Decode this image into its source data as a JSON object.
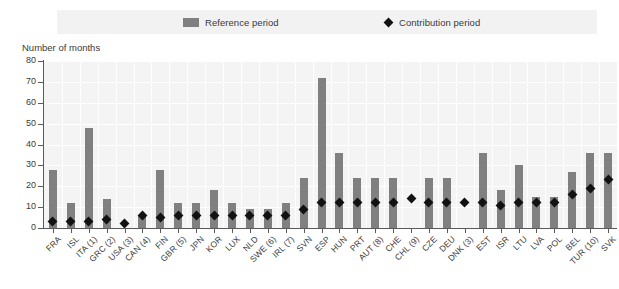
{
  "legend": {
    "reference": {
      "label": "Reference period",
      "icon": "bar-swatch",
      "color": "#808080"
    },
    "contribution": {
      "label": "Contribution period",
      "icon": "diamond-marker",
      "color": "#121212"
    }
  },
  "axis_title": "Number of months",
  "chart_data": {
    "type": "bar",
    "title": "",
    "subtitle": "",
    "xlabel": "",
    "ylabel": "Number of months",
    "ylim": [
      0,
      80
    ],
    "ytick_values": [
      0,
      10,
      20,
      30,
      40,
      50,
      60,
      70,
      80
    ],
    "ytick_labels": [
      "0",
      "10",
      "20",
      "30",
      "40",
      "50",
      "60",
      "70",
      "80"
    ],
    "grid": true,
    "legend_position": "top",
    "categories": [
      "FRA",
      "ISL",
      "ITA (1)",
      "GRC (2)",
      "USA (3)",
      "CAN (4)",
      "FIN",
      "GBR (5)",
      "JPN",
      "KOR",
      "LUX",
      "NLD",
      "SWE (6)",
      "IRL (7)",
      "SVN",
      "ESP",
      "HUN",
      "PRT",
      "AUT (8)",
      "CHE",
      "CHL (9)",
      "CZE",
      "DEU",
      "DNK (3)",
      "EST",
      "ISR",
      "LTU",
      "LVA",
      "POL",
      "BEL",
      "TUR (10)",
      "SVK"
    ],
    "series": [
      {
        "name": "Reference period",
        "type": "bar",
        "color": "#808080",
        "values": [
          28,
          12,
          48,
          14,
          0,
          6,
          28,
          12,
          12,
          18,
          12,
          9,
          9,
          12,
          24,
          72,
          36,
          24,
          24,
          24,
          0,
          24,
          24,
          0,
          36,
          18,
          30,
          15,
          15,
          27,
          36,
          36
        ]
      },
      {
        "name": "Contribution period",
        "type": "scatter",
        "marker": "diamond",
        "color": "#121212",
        "values": [
          3,
          3,
          3,
          4,
          2,
          6,
          5,
          6,
          6,
          6,
          6,
          6,
          6,
          6,
          9,
          12,
          12,
          12,
          12,
          12,
          14,
          12,
          12,
          12,
          12,
          11,
          12,
          12,
          12,
          16,
          19,
          23
        ]
      }
    ]
  }
}
